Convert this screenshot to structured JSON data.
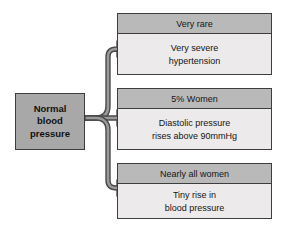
{
  "diagram": {
    "colors": {
      "background": "#ffffff",
      "source_fill": "#a8a8a8",
      "box_header_fill": "#b9b9b9",
      "box_body_fill": "#eceaea",
      "outline": "#3d3d3d",
      "arrow_fill": "#9a9a9a",
      "arrow_outline": "#4a4a4a",
      "text": "#141414"
    },
    "source": {
      "label": "Normal\nblood\npressure"
    },
    "outcomes": [
      {
        "header": "Very rare",
        "body": "Very severe\nhypertension"
      },
      {
        "header": "5% Women",
        "body": "Diastolic pressure\nrises above 90mmHg"
      },
      {
        "header": "Nearly all women",
        "body": "Tiny rise in\nblood pressure"
      }
    ],
    "connectors": [
      {
        "name": "arrow-to-very-rare",
        "direction": "up-then-right"
      },
      {
        "name": "arrow-to-5-percent-women",
        "direction": "right"
      },
      {
        "name": "arrow-to-nearly-all-women",
        "direction": "down-then-right"
      }
    ]
  }
}
